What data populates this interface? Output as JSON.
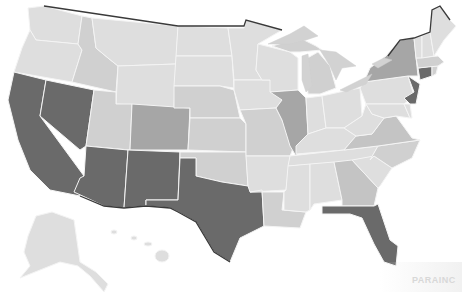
{
  "map": {
    "title": "United States choropleth (grayscale)",
    "legend_levels": {
      "lightest": "#dedede",
      "light": "#d0d0d0",
      "medium_light": "#c4c4c4",
      "medium": "#a6a6a6",
      "dark": "#6a6a6a"
    },
    "colors": {
      "background": "#ffffff",
      "state_border": "#f4f4f4",
      "national_border": "#3a3a3a",
      "lakes": "#d2d2d2"
    },
    "states": [
      {
        "id": "WA",
        "level": "lightest"
      },
      {
        "id": "OR",
        "level": "lightest"
      },
      {
        "id": "CA",
        "level": "dark"
      },
      {
        "id": "NV",
        "level": "dark"
      },
      {
        "id": "ID",
        "level": "light"
      },
      {
        "id": "MT",
        "level": "lightest"
      },
      {
        "id": "WY",
        "level": "lightest"
      },
      {
        "id": "UT",
        "level": "light"
      },
      {
        "id": "AZ",
        "level": "dark"
      },
      {
        "id": "CO",
        "level": "medium"
      },
      {
        "id": "NM",
        "level": "dark"
      },
      {
        "id": "ND",
        "level": "lightest"
      },
      {
        "id": "SD",
        "level": "lightest"
      },
      {
        "id": "NE",
        "level": "light"
      },
      {
        "id": "KS",
        "level": "light"
      },
      {
        "id": "OK",
        "level": "light"
      },
      {
        "id": "TX",
        "level": "dark"
      },
      {
        "id": "MN",
        "level": "lightest"
      },
      {
        "id": "IA",
        "level": "lightest"
      },
      {
        "id": "MO",
        "level": "light"
      },
      {
        "id": "AR",
        "level": "lightest"
      },
      {
        "id": "LA",
        "level": "light"
      },
      {
        "id": "WI",
        "level": "lightest"
      },
      {
        "id": "IL",
        "level": "medium"
      },
      {
        "id": "MI",
        "level": "light"
      },
      {
        "id": "IN",
        "level": "lightest"
      },
      {
        "id": "OH",
        "level": "lightest"
      },
      {
        "id": "KY",
        "level": "lightest"
      },
      {
        "id": "TN",
        "level": "lightest"
      },
      {
        "id": "MS",
        "level": "lightest"
      },
      {
        "id": "AL",
        "level": "lightest"
      },
      {
        "id": "GA",
        "level": "medium_light"
      },
      {
        "id": "FL",
        "level": "dark"
      },
      {
        "id": "SC",
        "level": "lightest"
      },
      {
        "id": "NC",
        "level": "light"
      },
      {
        "id": "VA",
        "level": "medium_light"
      },
      {
        "id": "WV",
        "level": "lightest"
      },
      {
        "id": "PA",
        "level": "lightest"
      },
      {
        "id": "NY",
        "level": "medium"
      },
      {
        "id": "NJ",
        "level": "dark"
      },
      {
        "id": "CT",
        "level": "dark"
      },
      {
        "id": "MA",
        "level": "light"
      },
      {
        "id": "VT",
        "level": "lightest"
      },
      {
        "id": "NH",
        "level": "lightest"
      },
      {
        "id": "ME",
        "level": "lightest"
      },
      {
        "id": "MD",
        "level": "lightest"
      },
      {
        "id": "DE",
        "level": "lightest"
      },
      {
        "id": "RI",
        "level": "light"
      },
      {
        "id": "AK",
        "level": "lightest"
      },
      {
        "id": "HI",
        "level": "lightest"
      }
    ]
  },
  "watermark": {
    "text": "PARAINC"
  }
}
